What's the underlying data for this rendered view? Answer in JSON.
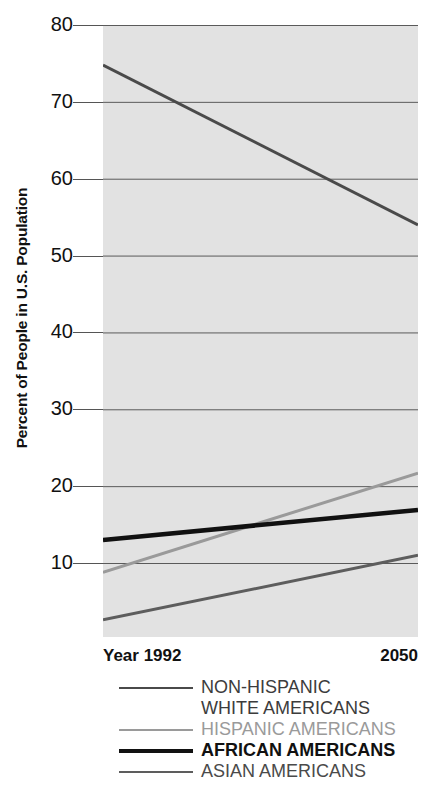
{
  "chart_data": {
    "type": "line",
    "title": "",
    "xlabel": "Year",
    "ylabel": "Percent of People in U.S. Population",
    "x": [
      1992,
      2050
    ],
    "x_tick_labels": [
      "Year 1992",
      "2050"
    ],
    "xlim": [
      1992,
      2050
    ],
    "ylim": [
      0,
      80
    ],
    "y_ticks": [
      80,
      70,
      60,
      50,
      40,
      30,
      20,
      10
    ],
    "y_tick_labels": [
      "80",
      "70",
      "60",
      "50",
      "40",
      "30",
      "20",
      "10"
    ],
    "grid": true,
    "grid_axis": "y",
    "legend_position": "below",
    "plot_background": "#e2e2e2",
    "series": [
      {
        "name": "NON-HISPANIC WHITE AMERICANS",
        "legend_label_line1": "NON-HISPANIC",
        "legend_label_line2": "WHITE AMERICANS",
        "color": "#4a4a4a",
        "width": 3,
        "bold": false,
        "values": [
          74.8,
          54.0
        ]
      },
      {
        "name": "HISPANIC AMERICANS",
        "legend_label_line1": "HISPANIC AMERICANS",
        "legend_label_line2": "",
        "color": "#9a9a9a",
        "width": 3,
        "bold": false,
        "values": [
          8.8,
          21.7
        ]
      },
      {
        "name": "AFRICAN AMERICANS",
        "legend_label_line1": "AFRICAN AMERICANS",
        "legend_label_line2": "",
        "color": "#111111",
        "width": 4.5,
        "bold": true,
        "values": [
          13.0,
          16.9
        ]
      },
      {
        "name": "ASIAN AMERICANS",
        "legend_label_line1": "ASIAN AMERICANS",
        "legend_label_line2": "",
        "color": "#5d5d5d",
        "width": 3,
        "bold": false,
        "values": [
          2.6,
          11.0
        ]
      }
    ]
  },
  "axis": {
    "y_title": "Percent of People in U.S. Population",
    "x_start_label": "Year 1992",
    "x_end_label": "2050",
    "ticks": [
      "80",
      "70",
      "60",
      "50",
      "40",
      "30",
      "20",
      "10"
    ]
  },
  "legend": {
    "rows": [
      {
        "label": "NON-HISPANIC",
        "color": "#4a4a4a",
        "text_color": "#3c3c3c",
        "bold": false
      },
      {
        "label": "WHITE AMERICANS",
        "color": "",
        "text_color": "#3c3c3c",
        "bold": false
      },
      {
        "label": "HISPANIC AMERICANS",
        "color": "#9a9a9a",
        "text_color": "#9a9a9a",
        "bold": false
      },
      {
        "label": "AFRICAN AMERICANS",
        "color": "#111111",
        "text_color": "#111111",
        "bold": true
      },
      {
        "label": "ASIAN AMERICANS",
        "color": "#5d5d5d",
        "text_color": "#4a4a4a",
        "bold": false
      }
    ]
  }
}
